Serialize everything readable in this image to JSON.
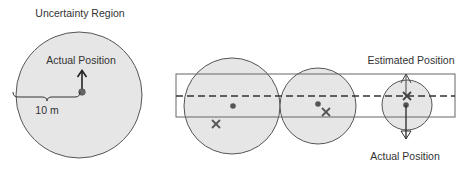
{
  "left_panel": {
    "title": "Uncertainty Region",
    "actual_position_label": "Actual Position",
    "radius_label": "10 m",
    "circle": {
      "cx": 79,
      "cy": 95,
      "r": 63
    },
    "dot": {
      "cx": 82,
      "cy": 92
    },
    "arrow": {
      "x": 82,
      "y1": 88,
      "y2": 70
    },
    "brace": {
      "x1": 13,
      "x2": 80,
      "y": 97
    }
  },
  "right_panel": {
    "estimated_position_label": "Estimated Position",
    "actual_position_label": "Actual Position",
    "corridor": {
      "x": 176,
      "y": 74,
      "width": 279,
      "height": 43
    },
    "dashed_line": {
      "x1": 176,
      "x2": 455,
      "y": 96
    },
    "circles": [
      {
        "cx": 232,
        "cy": 106,
        "r": 48,
        "dot": {
          "cx": 233,
          "cy": 106
        },
        "x_mark": {
          "cx": 216,
          "cy": 124
        }
      },
      {
        "cx": 318,
        "cy": 106,
        "r": 38,
        "dot": {
          "cx": 318,
          "cy": 104
        },
        "x_mark": {
          "cx": 326,
          "cy": 112
        }
      },
      {
        "cx": 407,
        "cy": 105,
        "r": 25,
        "dot": {
          "cx": 406,
          "cy": 105
        },
        "x_mark": {
          "cx": 407,
          "cy": 96
        }
      }
    ],
    "arrows": {
      "x": 406,
      "up_to": 75,
      "down_to": 139,
      "from": 105
    }
  },
  "colors": {
    "circle_fill": "#e6e6e6",
    "stroke": "#555555",
    "mark": "#555555",
    "text": "#333333"
  }
}
